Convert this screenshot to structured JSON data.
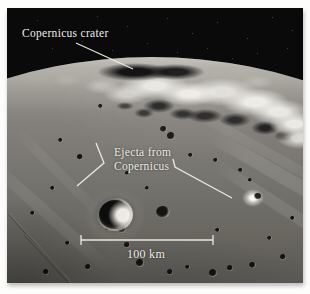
{
  "figure": {
    "type": "annotated lunar orbital photograph",
    "labels": {
      "crater": "Copernicus crater",
      "ejecta_line1": "Ejecta from",
      "ejecta_line2": "Copernicus",
      "scale": "100 km"
    },
    "colors": {
      "page_background": "#fdfdfb",
      "sky": "#0a0a0b",
      "annotation": "#f2efe8"
    }
  }
}
